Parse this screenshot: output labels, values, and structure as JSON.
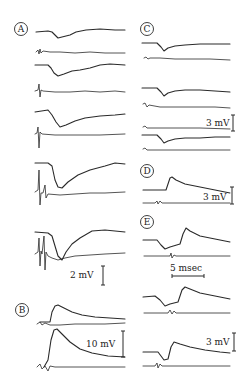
{
  "figure": {
    "panels": [
      {
        "id": "A",
        "label": "A",
        "trace_pairs": 6,
        "scale": "2 mV"
      },
      {
        "id": "B",
        "label": "B",
        "trace_pairs": 2,
        "scale": "10 mV"
      },
      {
        "id": "C",
        "label": "C",
        "trace_pairs": 3,
        "scale": "3 mV"
      },
      {
        "id": "D",
        "label": "D",
        "trace_pairs": 1,
        "scale": "3 mV"
      },
      {
        "id": "E",
        "label": "E",
        "trace_pairs": 3,
        "scale": "3 mV",
        "time_scale": "5 msec"
      }
    ],
    "scale_labels": {
      "a_voltage": "2 mV",
      "b_voltage": "10 mV",
      "c_voltage": "3 mV",
      "d_voltage": "3 mV",
      "e_voltage": "3 mV",
      "e_time": "5 msec"
    },
    "colors": {
      "ink": "#2a2a2a",
      "background": "#ffffff"
    }
  }
}
